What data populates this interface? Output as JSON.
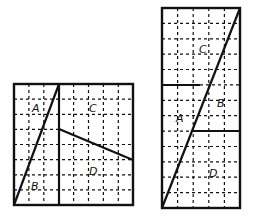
{
  "figures": [
    {
      "name": "square-8x8",
      "grid": {
        "cols": 8,
        "rows": 8
      },
      "labels": {
        "A": "A",
        "B": "B",
        "C": "C",
        "D": "D"
      }
    },
    {
      "name": "rectangle-5x13",
      "grid": {
        "cols": 5,
        "rows": 13
      },
      "labels": {
        "A": "A",
        "B": "B",
        "C": "C",
        "D": "D"
      }
    }
  ],
  "colors": {
    "ink": "#111111",
    "background": "#ffffff"
  }
}
